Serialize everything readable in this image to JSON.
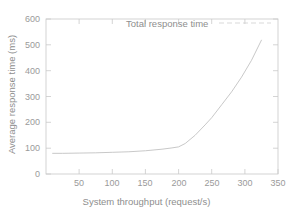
{
  "chart_data": {
    "type": "line",
    "title": "",
    "xlabel": "System throughput (request/s)",
    "ylabel": "Average response time (ms)",
    "xlim": [
      0,
      350
    ],
    "ylim": [
      0,
      600
    ],
    "xticks": [
      50,
      100,
      150,
      200,
      250,
      300,
      350
    ],
    "yticks": [
      0,
      100,
      200,
      300,
      400,
      500,
      600
    ],
    "grid": false,
    "legend_position": "top-center",
    "series": [
      {
        "name": "Total response time",
        "x": [
          10,
          25,
          50,
          75,
          100,
          125,
          150,
          175,
          190,
          200,
          210,
          225,
          240,
          250,
          265,
          280,
          295,
          310,
          325
        ],
        "values": [
          80,
          80,
          81,
          82,
          84,
          86,
          90,
          96,
          101,
          105,
          118,
          150,
          190,
          218,
          268,
          318,
          375,
          440,
          518
        ]
      }
    ]
  },
  "legend": {
    "entries": [
      {
        "label": "Total response time",
        "style": "dashed-line",
        "color": "#bdbdbd"
      }
    ]
  },
  "axes": {
    "y_tick_labels": [
      "600",
      "500",
      "400",
      "300",
      "200",
      "100",
      "0"
    ],
    "x_tick_labels": [
      "50",
      "100",
      "150",
      "200",
      "250",
      "300",
      "350"
    ],
    "x_title": "System throughput (request/s)",
    "y_title": "Average response time (ms)"
  },
  "colors": {
    "frame": "#c9c9c9",
    "tick": "#c9c9c9",
    "curve": "#c4c4c4",
    "text": "#8e8e8e",
    "background": "#ffffff"
  }
}
